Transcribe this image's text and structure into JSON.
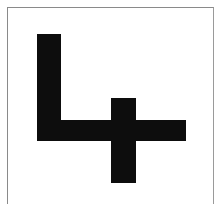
{
  "figure": {
    "fill_color": "#0d0d0d",
    "background_color": "#ffffff",
    "frame_color": "#8a8a8a",
    "shapes": [
      {
        "name": "l-vertical-bar",
        "x": 37,
        "y": 34,
        "width": 24,
        "height": 107
      },
      {
        "name": "l-horizontal-bar",
        "x": 37,
        "y": 120,
        "width": 149,
        "height": 21
      },
      {
        "name": "cross-vertical-bar",
        "x": 111,
        "y": 98,
        "width": 25,
        "height": 85
      }
    ]
  }
}
